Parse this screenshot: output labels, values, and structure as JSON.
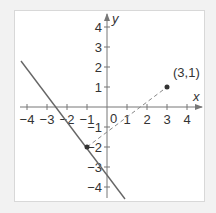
{
  "chart_data": {
    "type": "line",
    "title": "",
    "xlabel": "x",
    "ylabel": "y",
    "xlim": [
      -4,
      4
    ],
    "ylim": [
      -4,
      4
    ],
    "x_ticks": [
      "-4",
      "-3",
      "-2",
      "-1",
      "1",
      "2",
      "3",
      "4"
    ],
    "y_ticks": [
      "4",
      "3",
      "2",
      "1",
      "-1",
      "-2",
      "-3",
      "-4"
    ],
    "origin_label": "0",
    "grid": false,
    "series": [
      {
        "name": "solid line",
        "style": "solid",
        "points": [
          [
            -4.3,
            2.3
          ],
          [
            0.9,
            -4.6
          ]
        ]
      },
      {
        "name": "dashed segment",
        "style": "dashed",
        "points": [
          [
            -1,
            -2
          ],
          [
            3,
            1
          ]
        ]
      }
    ],
    "points": [
      {
        "x": 3,
        "y": 1,
        "label": "(3,1)"
      },
      {
        "x": -1,
        "y": -2,
        "label": ""
      }
    ]
  },
  "labels": {
    "x_axis": "x",
    "y_axis": "y",
    "origin": "0",
    "point_label": "(3,1)"
  }
}
